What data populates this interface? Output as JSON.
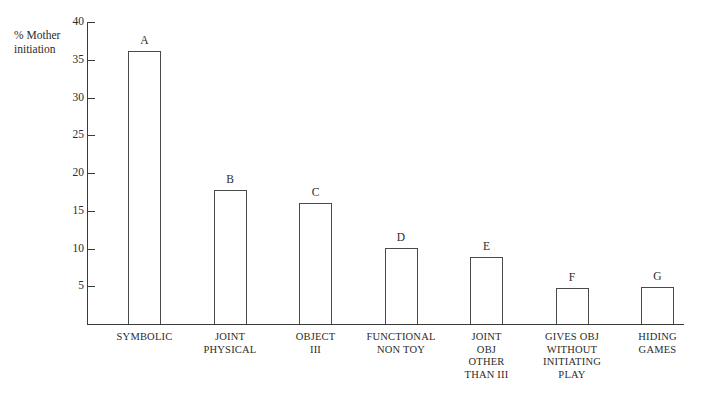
{
  "chart_data": {
    "type": "bar",
    "title": "",
    "subtitle": "",
    "xlabel": "",
    "ylabel": "% Mother initiation",
    "ylim": [
      0,
      40
    ],
    "ytick_values": [
      5,
      10,
      15,
      20,
      25,
      30,
      35,
      40
    ],
    "ytick_labels": [
      "5",
      "10",
      "15",
      "20",
      "25",
      "30",
      "35",
      "40"
    ],
    "grid": false,
    "legend": false,
    "categories": [
      "SYMBOLIC",
      "JOINT PHYSICAL",
      "OBJECT III",
      "FUNCTIONAL NON TOY",
      "JOINT OBJ OTHER THAN III",
      "GIVES OBJ WITHOUT INITIATING PLAY",
      "HIDING GAMES"
    ],
    "point_labels": [
      "A",
      "B",
      "C",
      "D",
      "E",
      "F",
      "G"
    ],
    "values": [
      36.2,
      17.7,
      16.0,
      10.1,
      8.9,
      4.8,
      4.9
    ]
  },
  "axis": {
    "y_title": "% Mother initiation"
  },
  "bars": [
    {
      "letter": "A",
      "value": 36.2,
      "label_lines": [
        "SYMBOLIC"
      ]
    },
    {
      "letter": "B",
      "value": 17.7,
      "label_lines": [
        "JOINT",
        "PHYSICAL"
      ]
    },
    {
      "letter": "C",
      "value": 16.0,
      "label_lines": [
        "OBJECT",
        "III"
      ]
    },
    {
      "letter": "D",
      "value": 10.1,
      "label_lines": [
        "FUNCTIONAL",
        "NON TOY"
      ]
    },
    {
      "letter": "E",
      "value": 8.9,
      "label_lines": [
        "JOINT",
        "OBJ",
        "OTHER",
        "THAN III"
      ]
    },
    {
      "letter": "F",
      "value": 4.8,
      "label_lines": [
        "GIVES OBJ",
        "WITHOUT",
        "INITIATING",
        "PLAY"
      ]
    },
    {
      "letter": "G",
      "value": 4.9,
      "label_lines": [
        "HIDING",
        "GAMES"
      ]
    }
  ],
  "style": {
    "line_color": "#3a3a3a",
    "bar_stroke": "#4a4a4a",
    "bar_fill": "#ffffff",
    "text_color": "#2b2b2b",
    "background": "#ffffff"
  }
}
